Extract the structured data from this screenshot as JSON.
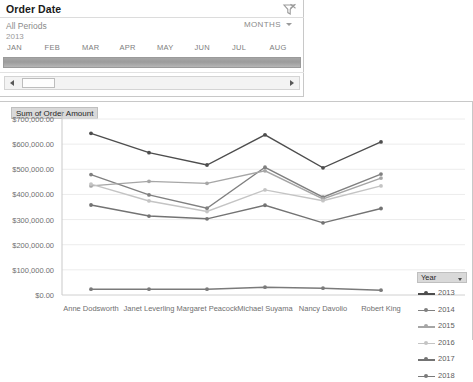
{
  "slicer": {
    "title": "Order Date",
    "clear_icon": "clear-filter-funnel-icon",
    "period_label": "All Periods",
    "year_label": "2013",
    "level": "MONTHS",
    "level_caret_icon": "chevron-down-icon",
    "months": [
      "JAN",
      "FEB",
      "MAR",
      "APR",
      "MAY",
      "JUN",
      "JUL",
      "AUG"
    ],
    "scroll_left_icon": "caret-left-icon",
    "scroll_right_icon": "caret-right-icon"
  },
  "chart_panel": {
    "value_field_label": "Sum of Order Amount"
  },
  "legend": {
    "title": "Year",
    "caret_icon": "chevron-down-icon",
    "items": [
      "2013",
      "2014",
      "2015",
      "2016",
      "2017",
      "2018"
    ]
  },
  "chart_data": {
    "type": "line",
    "title": "Sum of Order Amount",
    "xlabel": "",
    "ylabel": "",
    "ylim": [
      0,
      700000
    ],
    "ytick_labels": [
      "$700,000.00",
      "$600,000.00",
      "$500,000.00",
      "$400,000.00",
      "$300,000.00",
      "$200,000.00",
      "$100,000.00",
      "$0.00"
    ],
    "yticks": [
      700000,
      600000,
      500000,
      400000,
      300000,
      200000,
      100000,
      0
    ],
    "grid": true,
    "legend_position": "right",
    "categories": [
      "Anne Dodsworth",
      "Janet Leverling",
      "Margaret Peacock",
      "Michael Suyama",
      "Nancy Davolio",
      "Robert King"
    ],
    "series": [
      {
        "name": "2013",
        "color": "#4d4d4d",
        "values": [
          643000,
          566000,
          517000,
          637000,
          506000,
          609000
        ]
      },
      {
        "name": "2014",
        "color": "#808080",
        "values": [
          479000,
          398000,
          345000,
          508000,
          389000,
          481000
        ]
      },
      {
        "name": "2015",
        "color": "#a6a6a6",
        "values": [
          434000,
          452000,
          444000,
          494000,
          382000,
          465000
        ]
      },
      {
        "name": "2016",
        "color": "#c4c4c4",
        "values": [
          441000,
          374000,
          332000,
          418000,
          375000,
          434000
        ]
      },
      {
        "name": "2017",
        "color": "#737373",
        "values": [
          358000,
          314000,
          303000,
          357000,
          287000,
          344000
        ]
      },
      {
        "name": "2018",
        "color": "#7a7a7a",
        "values": [
          23000,
          23000,
          23000,
          31000,
          27000,
          19000
        ]
      }
    ]
  }
}
